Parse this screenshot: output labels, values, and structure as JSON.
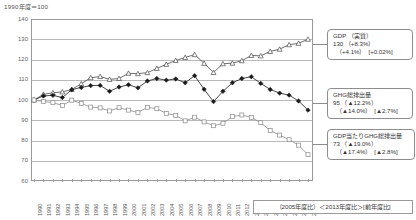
{
  "axis_unit_note": "1990年度＝100",
  "footer_legend": "（2005年度比）＜2013年度比＞[前年度比]",
  "callouts": {
    "gdp": {
      "name": "gdp-callout",
      "title": "GDP （実質）",
      "main": "130  （+8.3%）",
      "sub": "（+4.1%）　[+0.02%]"
    },
    "ghg": {
      "name": "ghg-callout",
      "title": "GHG総排出量",
      "main": "95  （▲12.2%）",
      "sub": "（▲14.0%）　[▲2.7%]"
    },
    "intensity": {
      "name": "gdp-per-ghg-callout",
      "title": "GDP当たりGHG総排出量",
      "main": "73  （▲19.0%）",
      "sub": "（▲17.4%）　[▲2.8%]"
    }
  },
  "chart_data": {
    "type": "line",
    "title": "",
    "xlabel": "",
    "ylabel": "1990年度＝100",
    "ylim": [
      60,
      140
    ],
    "yticks": [
      60,
      70,
      80,
      90,
      100,
      110,
      120,
      130,
      140
    ],
    "grid": true,
    "legend_position": "callout-right",
    "categories": [
      "1990",
      "1991",
      "1992",
      "1993",
      "1994",
      "1995",
      "1996",
      "1997",
      "1998",
      "1999",
      "2000",
      "2001",
      "2002",
      "2003",
      "2004",
      "2005",
      "2006",
      "2007",
      "2008",
      "2009",
      "2010",
      "2011",
      "2012",
      "2013",
      "2014",
      "2015",
      "2016",
      "2017",
      "2018",
      "2019"
    ],
    "series": [
      {
        "name": "GDP（実質）",
        "marker": "triangle-open",
        "color": "#4a4a4a",
        "values": [
          100.0,
          102.8,
          103.6,
          104.0,
          105.2,
          108.0,
          111.0,
          111.6,
          110.2,
          110.6,
          113.2,
          113.0,
          113.5,
          115.6,
          117.6,
          119.5,
          121.0,
          122.4,
          118.1,
          113.6,
          117.9,
          118.2,
          119.4,
          122.0,
          121.8,
          124.0,
          125.1,
          127.3,
          128.0,
          130.0
        ]
      },
      {
        "name": "GHG総排出量",
        "marker": "diamond-filled",
        "color": "#1a1a1a",
        "values": [
          100.0,
          102.0,
          102.3,
          101.2,
          105.1,
          106.2,
          107.1,
          107.2,
          104.3,
          106.4,
          107.5,
          106.0,
          109.4,
          110.6,
          109.8,
          110.4,
          108.5,
          112.0,
          105.3,
          99.2,
          104.3,
          108.5,
          110.6,
          111.5,
          108.2,
          105.2,
          103.4,
          102.4,
          99.5,
          95.0
        ]
      },
      {
        "name": "GDP当たりGHG総排出量",
        "marker": "square-open",
        "color": "#8a8a8a",
        "values": [
          100.0,
          99.2,
          98.7,
          97.3,
          99.9,
          98.3,
          96.5,
          96.1,
          94.6,
          96.2,
          95.0,
          93.8,
          96.4,
          95.7,
          93.4,
          92.4,
          89.7,
          91.5,
          89.2,
          87.3,
          88.5,
          91.8,
          92.6,
          91.4,
          88.8,
          84.9,
          82.7,
          80.4,
          77.7,
          73.0
        ]
      }
    ]
  }
}
